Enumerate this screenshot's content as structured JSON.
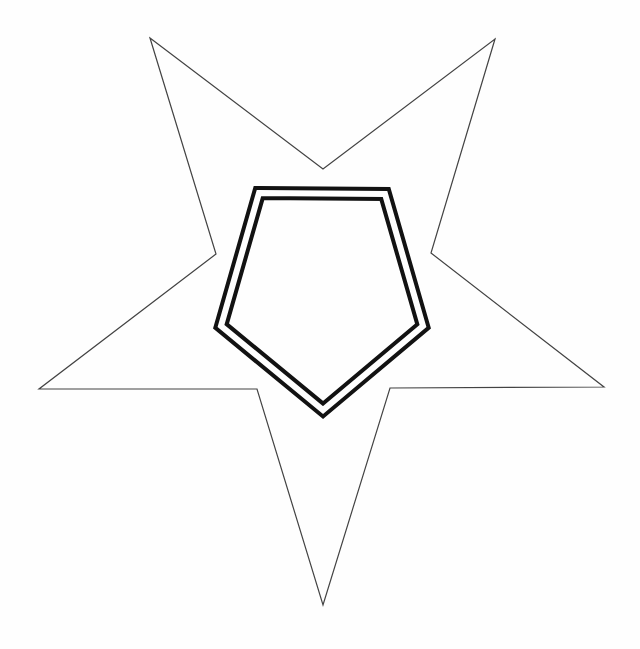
{
  "canvas": {
    "width": "640",
    "height": "649",
    "viewbox": "0 0 640 649",
    "background": "#fefefe"
  },
  "star_outline": {
    "description": "inverted five-pointed star outline, one point down and two points up",
    "points": "150,38 323,169 495,39 431,253 604,387 390,388 323,605 257,389 39,389 216,254",
    "stroke": "#434343",
    "stroke_width": "1.2",
    "fill": "none"
  },
  "pentagon_band": {
    "description": "thick black band forming double-outlined pentagon, point down",
    "points": "259,193 385,194 423,326 323,410 221,326",
    "stroke": "#121212",
    "stroke_width": "14",
    "fill": "none"
  },
  "pentagon_gap": {
    "description": "white gap line splitting the thick band into two concentric outlines",
    "points": "259,193 385,194 423,326 323,410 221,326",
    "stroke": "#fefefe",
    "stroke_width": "6",
    "fill": "none"
  }
}
